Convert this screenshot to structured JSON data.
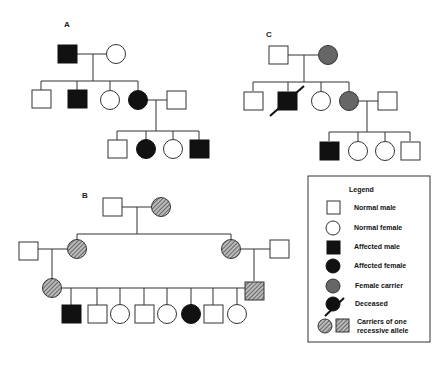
{
  "pedigrees": [
    {
      "label": "A"
    },
    {
      "label": "B"
    },
    {
      "label": "C"
    }
  ],
  "legend": {
    "title": "Legend",
    "items": [
      {
        "symbol": "open-square",
        "label": "Normal male"
      },
      {
        "symbol": "open-circle",
        "label": "Normal female"
      },
      {
        "symbol": "filled-square",
        "label": "Affected male"
      },
      {
        "symbol": "filled-circle",
        "label": "Affected female"
      },
      {
        "symbol": "grey-circle",
        "label": "Female carrier"
      },
      {
        "symbol": "slashed-filled-circle",
        "label": "Deceased"
      },
      {
        "symbol": "hatched-circle-and-square",
        "label": "Carriers of one",
        "label2": "recessive allele"
      }
    ]
  },
  "colors": {
    "affected": "#111111",
    "carrier": "#666666",
    "line": "#333333",
    "background": "#ffffff"
  }
}
